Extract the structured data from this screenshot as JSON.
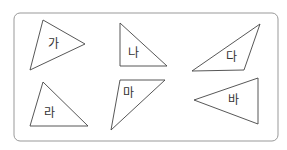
{
  "frame": {
    "stroke": "#999999"
  },
  "triangles": [
    {
      "label": "가",
      "points": "43,20 85,44 30,70",
      "lx": 48,
      "ly": 48
    },
    {
      "label": "나",
      "points": "120,23 167,66 120,66",
      "lx": 128,
      "ly": 57
    },
    {
      "label": "다",
      "points": "260,24 244,70 192,71",
      "lx": 226,
      "ly": 61
    },
    {
      "label": "라",
      "points": "43,82 88,126 30,126",
      "lx": 44,
      "ly": 117
    },
    {
      "label": "마",
      "points": "120,80 165,80 111,130",
      "lx": 123,
      "ly": 97
    },
    {
      "label": "바",
      "points": "258,78 258,124 194,100",
      "lx": 228,
      "ly": 104
    }
  ]
}
